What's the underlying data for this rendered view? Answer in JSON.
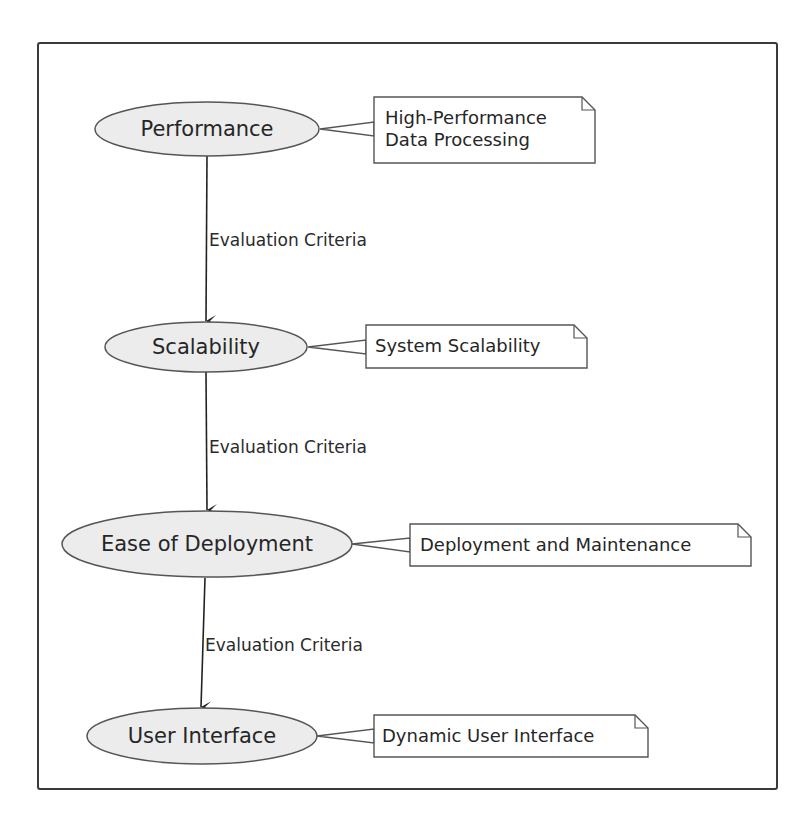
{
  "diagram": {
    "type": "flow",
    "colors": {
      "node_fill": "#ececec",
      "node_stroke": "#555555",
      "note_fill": "#ffffff",
      "note_stroke": "#555555",
      "arrow": "#222222",
      "frame": "#3a3a3a"
    },
    "nodes": [
      {
        "id": "performance",
        "label": "Performance",
        "note": "High-Performance\nData Processing"
      },
      {
        "id": "scalability",
        "label": "Scalability",
        "note": "System Scalability"
      },
      {
        "id": "ease_of_deployment",
        "label": "Ease of Deployment",
        "note": "Deployment and Maintenance"
      },
      {
        "id": "user_interface",
        "label": "User Interface",
        "note": "Dynamic User Interface"
      }
    ],
    "edges": [
      {
        "from": "performance",
        "to": "scalability",
        "label": "Evaluation Criteria"
      },
      {
        "from": "scalability",
        "to": "ease_of_deployment",
        "label": "Evaluation Criteria"
      },
      {
        "from": "ease_of_deployment",
        "to": "user_interface",
        "label": "Evaluation Criteria"
      }
    ]
  }
}
